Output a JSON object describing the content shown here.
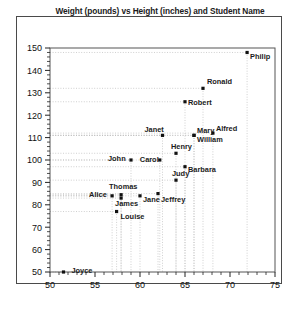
{
  "chart": {
    "title": "Weight (pounds) vs Height (inches) and Student Name",
    "frame_color": "#4a4a4a",
    "marker_color": "#111111",
    "grid_color": "#bbbbbb"
  },
  "chart_data": {
    "type": "scatter",
    "title": "Weight (pounds) vs Height (inches) and Student Name",
    "xlabel": "",
    "ylabel": "",
    "xlim": [
      50,
      75
    ],
    "ylim": [
      50,
      150
    ],
    "xticks": [
      50,
      55,
      60,
      65,
      70,
      75
    ],
    "yticks": [
      50,
      60,
      70,
      80,
      90,
      100,
      110,
      120,
      130,
      140,
      150
    ],
    "grid": true,
    "grid_style": "dotted-leader-lines",
    "legend": "none",
    "point_labels": true,
    "points": [
      {
        "name": "Joyce",
        "x": 51.5,
        "y": 50,
        "label_dx": 8,
        "label_dy": 1
      },
      {
        "name": "Louise",
        "x": 57.4,
        "y": 77,
        "label_dx": 4,
        "label_dy": 7
      },
      {
        "name": "Alice",
        "x": 56.9,
        "y": 84,
        "label_dx": -23,
        "label_dy": 1
      },
      {
        "name": "Thomas",
        "x": 57.9,
        "y": 84.5,
        "label_dx": -12,
        "label_dy": -6
      },
      {
        "name": "James",
        "x": 57.9,
        "y": 83,
        "label_dx": -6,
        "label_dy": 8
      },
      {
        "name": "Jane",
        "x": 60.0,
        "y": 84,
        "label_dx": 3,
        "label_dy": 6
      },
      {
        "name": "Jeffrey",
        "x": 62.0,
        "y": 85,
        "label_dx": 3,
        "label_dy": 8
      },
      {
        "name": "Judy",
        "x": 64.0,
        "y": 91,
        "label_dx": -4,
        "label_dy": -4
      },
      {
        "name": "Barbara",
        "x": 65.0,
        "y": 97,
        "label_dx": 3,
        "label_dy": 5
      },
      {
        "name": "John",
        "x": 59.0,
        "y": 100,
        "label_dx": -23,
        "label_dy": 1
      },
      {
        "name": "Carol",
        "x": 62.2,
        "y": 100,
        "label_dx": -20,
        "label_dy": 2
      },
      {
        "name": "Henry",
        "x": 64.0,
        "y": 103,
        "label_dx": -5,
        "label_dy": -4
      },
      {
        "name": "Janet",
        "x": 62.5,
        "y": 111,
        "label_dx": -18,
        "label_dy": -3
      },
      {
        "name": "Mary",
        "x": 66.0,
        "y": 111,
        "label_dx": 3,
        "label_dy": -2
      },
      {
        "name": "William",
        "x": 66.0,
        "y": 111,
        "label_dx": 3,
        "label_dy": 7
      },
      {
        "name": "Alfred",
        "x": 68.1,
        "y": 112,
        "label_dx": 3,
        "label_dy": -2
      },
      {
        "name": "Robert",
        "x": 65.0,
        "y": 126,
        "label_dx": 3,
        "label_dy": 3
      },
      {
        "name": "Ronald",
        "x": 67.0,
        "y": 132,
        "label_dx": 4,
        "label_dy": -4
      },
      {
        "name": "Philip",
        "x": 71.9,
        "y": 148,
        "label_dx": 3,
        "label_dy": 7
      }
    ]
  }
}
